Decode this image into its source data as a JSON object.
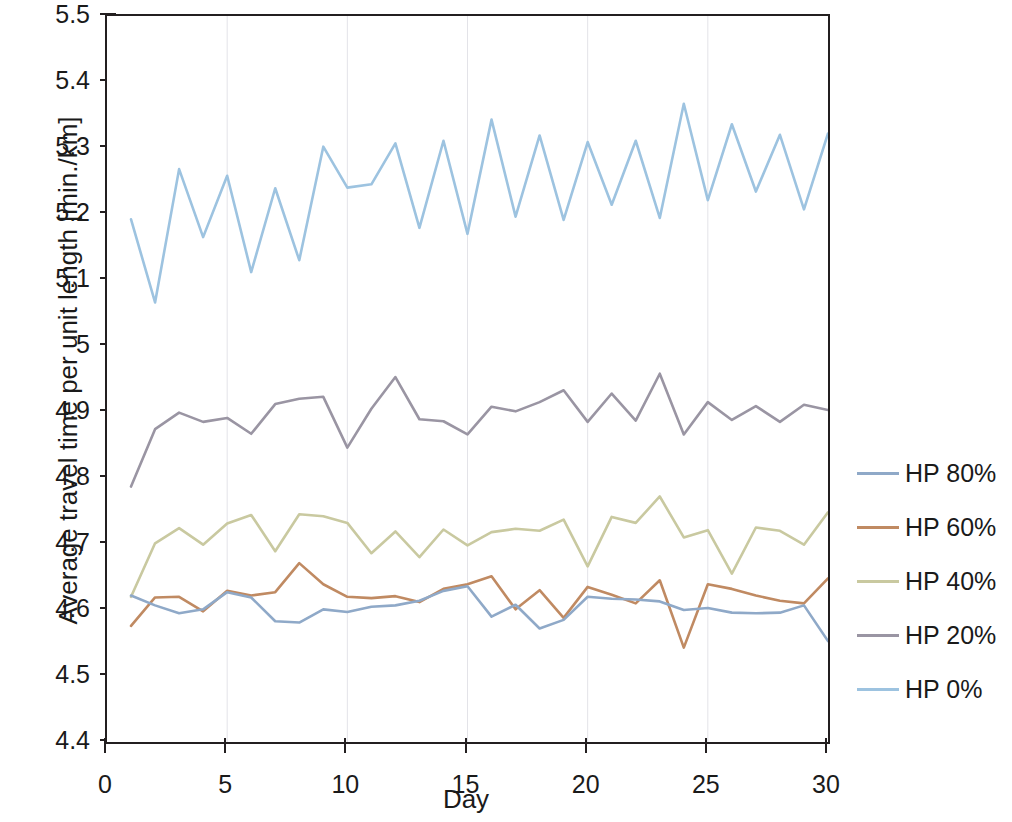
{
  "chart_data": {
    "type": "line",
    "title": "",
    "xlabel": "Day",
    "ylabel": "Average travel time per unit length [min./km]",
    "xlim": [
      0,
      30
    ],
    "ylim": [
      4.4,
      5.5
    ],
    "xticks": [
      "0",
      "5",
      "10",
      "15",
      "20",
      "25",
      "30"
    ],
    "xtick_values": [
      0,
      5,
      10,
      15,
      20,
      25,
      30
    ],
    "yticks": [
      "5.5",
      "5.4",
      "5.3",
      "5.2",
      "5.1",
      "5",
      "4.9",
      "4.8",
      "4.7",
      "4.6",
      "4.5",
      "4.4"
    ],
    "ytick_values": [
      5.5,
      5.4,
      5.3,
      5.2,
      5.1,
      5.0,
      4.9,
      4.8,
      4.7,
      4.6,
      4.5,
      4.4
    ],
    "grid": "vertical-only",
    "legend_position": "right",
    "x": [
      1,
      2,
      3,
      4,
      5,
      6,
      7,
      8,
      9,
      10,
      11,
      12,
      13,
      14,
      15,
      16,
      17,
      18,
      19,
      20,
      21,
      22,
      23,
      24,
      25,
      26,
      27,
      28,
      29,
      30
    ],
    "series": [
      {
        "name": "HP 80%",
        "color": "#8fa9c8",
        "values": [
          4.622,
          4.607,
          4.595,
          4.601,
          4.627,
          4.619,
          4.583,
          4.581,
          4.601,
          4.597,
          4.605,
          4.607,
          4.614,
          4.629,
          4.636,
          4.59,
          4.608,
          4.572,
          4.585,
          4.62,
          4.617,
          4.616,
          4.613,
          4.6,
          4.603,
          4.596,
          4.595,
          4.596,
          4.607,
          4.553
        ]
      },
      {
        "name": "HP 60%",
        "color": "#c08a62",
        "values": [
          4.576,
          4.619,
          4.62,
          4.598,
          4.629,
          4.622,
          4.627,
          4.671,
          4.639,
          4.62,
          4.618,
          4.621,
          4.612,
          4.632,
          4.639,
          4.651,
          4.601,
          4.63,
          4.588,
          4.635,
          4.623,
          4.61,
          4.645,
          4.543,
          4.639,
          4.632,
          4.622,
          4.614,
          4.61,
          4.648
        ]
      },
      {
        "name": "HP 40%",
        "color": "#c9c9a0",
        "values": [
          4.62,
          4.701,
          4.724,
          4.699,
          4.731,
          4.744,
          4.689,
          4.745,
          4.742,
          4.732,
          4.686,
          4.719,
          4.68,
          4.722,
          4.698,
          4.718,
          4.723,
          4.72,
          4.737,
          4.666,
          4.741,
          4.732,
          4.772,
          4.71,
          4.721,
          4.655,
          4.725,
          4.72,
          4.699,
          4.748
        ]
      },
      {
        "name": "HP 20%",
        "color": "#9a95a3",
        "values": [
          4.787,
          4.874,
          4.899,
          4.885,
          4.891,
          4.867,
          4.912,
          4.92,
          4.923,
          4.846,
          4.905,
          4.953,
          4.889,
          4.886,
          4.866,
          4.908,
          4.901,
          4.915,
          4.933,
          4.885,
          4.928,
          4.887,
          4.958,
          4.866,
          4.915,
          4.888,
          4.909,
          4.885,
          4.911,
          4.903
        ]
      },
      {
        "name": "HP 0%",
        "color": "#9dc3e0",
        "values": [
          5.192,
          5.066,
          5.268,
          5.165,
          5.258,
          5.112,
          5.239,
          5.13,
          5.302,
          5.24,
          5.245,
          5.307,
          5.179,
          5.311,
          5.17,
          5.343,
          5.196,
          5.319,
          5.191,
          5.309,
          5.214,
          5.311,
          5.194,
          5.367,
          5.221,
          5.336,
          5.234,
          5.32,
          5.207,
          5.322
        ]
      }
    ]
  },
  "legend": {
    "entries": [
      {
        "label": "HP 80%"
      },
      {
        "label": "HP 60%"
      },
      {
        "label": "HP 40%"
      },
      {
        "label": "HP 20%"
      },
      {
        "label": "HP 0%"
      }
    ]
  },
  "axes": {
    "x_title": "Day",
    "y_title": "Average travel time per unit length [min./km]"
  },
  "colors": {
    "axis": "#231f20",
    "grid": "#e3e3e8",
    "background": "#ffffff"
  }
}
